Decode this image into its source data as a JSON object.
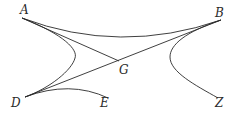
{
  "diagram": {
    "type": "geometric-figure",
    "stroke_color": "#2a2a2a",
    "background": "#ffffff",
    "labels": {
      "A": "A",
      "B": "B",
      "G": "G",
      "D": "D",
      "E": "E",
      "Z": "Z"
    },
    "points": {
      "A": [
        22,
        18
      ],
      "B": [
        221,
        20
      ],
      "G": [
        119,
        61
      ],
      "D": [
        25,
        97
      ],
      "E": [
        108,
        98
      ],
      "Z": [
        218,
        98
      ]
    },
    "segments": [
      {
        "from": "A",
        "to": "G"
      },
      {
        "from": "D",
        "to": "B"
      }
    ],
    "curves": [
      {
        "name": "curve-A-B",
        "description": "upper arc from A to B"
      },
      {
        "name": "left-hyperbola-branch",
        "description": "from A through left vertex to D"
      },
      {
        "name": "curve-D-E",
        "description": "arc from D to E"
      },
      {
        "name": "right-hyperbola-branch",
        "description": "from B through right vertex to Z"
      }
    ]
  }
}
